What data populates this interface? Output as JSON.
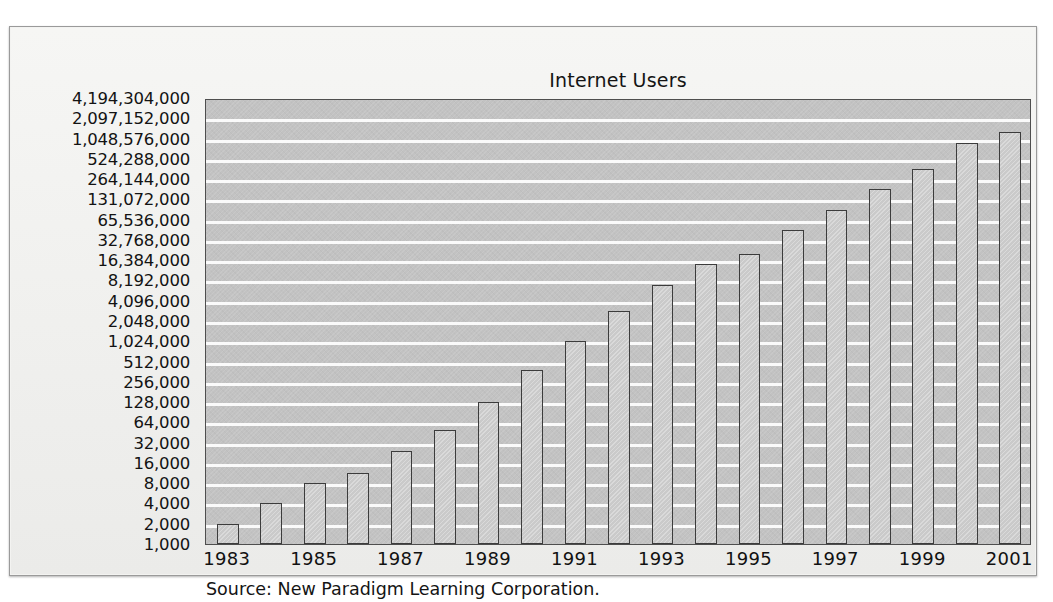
{
  "figure": {
    "title": "Internet Users",
    "source_note": "Source: New Paradigm Learning Corporation."
  },
  "colors": {
    "plot_background": "#c2c2c2",
    "bar_fill": "#cacaca",
    "bar_outline": "#3c3c3c",
    "gridline": "#fdfdfd",
    "page_background": "#f3f3f1",
    "text": "#131313"
  },
  "chart_data": {
    "type": "bar",
    "title": "Internet Users",
    "xlabel": "",
    "ylabel": "",
    "yscale": "log2",
    "grid": true,
    "legend": null,
    "ylim": [
      1000,
      4194304000
    ],
    "categories": [
      "1983",
      "1984",
      "1985",
      "1986",
      "1987",
      "1988",
      "1989",
      "1990",
      "1991",
      "1992",
      "1993",
      "1994",
      "1995",
      "1996",
      "1997",
      "1998",
      "1999",
      "2000",
      "2001"
    ],
    "xtick_labels": [
      "1983",
      "1985",
      "1987",
      "1989",
      "1991",
      "1993",
      "1995",
      "1997",
      "1999",
      "2001"
    ],
    "ytick_labels": [
      "4,194,304,000",
      "2,097,152,000",
      "1,048,576,000",
      "524,288,000",
      "264,144,000",
      "131,072,000",
      "65,536,000",
      "32,768,000",
      "16,384,000",
      "8,192,000",
      "4,096,000",
      "2,048,000",
      "1,024,000",
      "512,000",
      "256,000",
      "128,000",
      "64,000",
      "32,000",
      "16,000",
      "8,000",
      "4,000",
      "2,000",
      "1,000"
    ],
    "ytick_values": [
      4194304000,
      2097152000,
      1048576000,
      524288000,
      264144000,
      131072000,
      65536000,
      32768000,
      16384000,
      8192000,
      4096000,
      2048000,
      1024000,
      512000,
      256000,
      128000,
      64000,
      32000,
      16000,
      8000,
      4000,
      2000,
      1000
    ],
    "values": [
      2000,
      4000,
      8000,
      11000,
      24000,
      48000,
      128000,
      400000,
      1024000,
      2800000,
      7000000,
      14000000,
      20000000,
      45000000,
      96000000,
      190000000,
      380000000,
      950000000,
      1300000000
    ],
    "bar_steps_above_baseline": [
      1,
      2,
      3,
      3.5,
      4.6,
      5.6,
      7,
      8.6,
      10,
      11.5,
      12.8,
      13.8,
      14.3,
      15.5,
      16.5,
      17.5,
      18.5,
      19.8,
      20.3
    ]
  }
}
